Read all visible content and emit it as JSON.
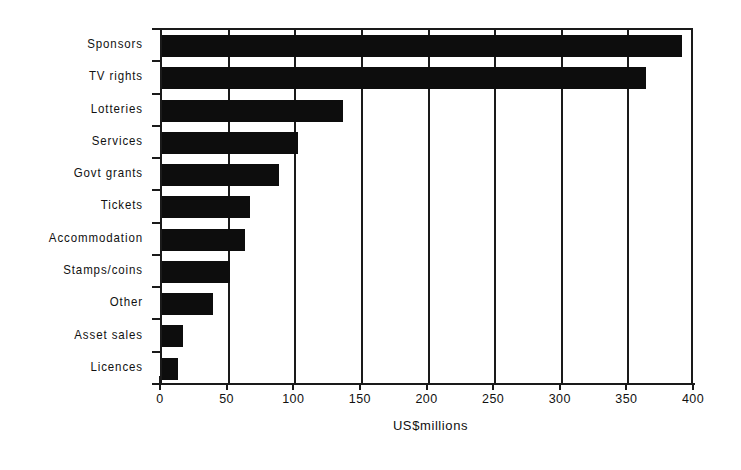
{
  "chart_data": {
    "type": "bar",
    "orientation": "horizontal",
    "title": "",
    "subtitle": "",
    "xlabel": "US$millions",
    "ylabel": "",
    "xlim": [
      0,
      400
    ],
    "xticks": [
      0,
      50,
      100,
      150,
      200,
      250,
      300,
      350,
      400
    ],
    "xtick_labels": [
      "0",
      "50",
      "100",
      "150",
      "200",
      "250",
      "300",
      "350",
      "400"
    ],
    "grid": "vertical",
    "legend": "none",
    "bar_color": "#0d0d0d",
    "axis_color": "#1a1a1a",
    "background": "#ffffff",
    "categories": [
      "Sponsors",
      "TV rights",
      "Lotteries",
      "Services",
      "Govt grants",
      "Tickets",
      "Accommodation",
      "Stamps/coins",
      "Other",
      "Asset sales",
      "Licences"
    ],
    "values": [
      390,
      363,
      136,
      102,
      88,
      66,
      62,
      51,
      38,
      16,
      12
    ]
  }
}
